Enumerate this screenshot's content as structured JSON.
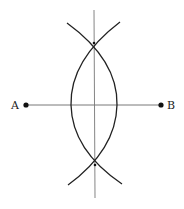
{
  "diagram": {
    "type": "perpendicular-bisector-construction",
    "points": [
      {
        "label": "A",
        "x": 26,
        "y": 105
      },
      {
        "label": "B",
        "x": 161,
        "y": 105
      }
    ],
    "intersections": [
      {
        "x": 94,
        "y": 43
      },
      {
        "x": 95,
        "y": 165
      }
    ],
    "colors": {
      "stroke": "#222222",
      "bisector": "#777777",
      "background": "#ffffff"
    }
  }
}
